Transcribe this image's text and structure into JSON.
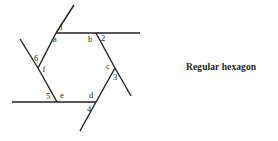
{
  "figure": {
    "caption": {
      "text": "Regular hexagon",
      "x": 186,
      "y": 62
    },
    "stroke_color": "#231f20",
    "background_color": "#ffffff",
    "shape": {
      "name": "regular-hexagon",
      "vertices": [
        {
          "label": "a",
          "x": 56,
          "y": 33,
          "label_x": 55,
          "label_y": 40
        },
        {
          "label": "b",
          "x": 96,
          "y": 33,
          "label_x": 90,
          "label_y": 40
        },
        {
          "label": "c",
          "x": 115,
          "y": 68,
          "label_x": 108,
          "label_y": 67
        },
        {
          "label": "d",
          "x": 96,
          "y": 102,
          "label_x": 91,
          "label_y": 96
        },
        {
          "label": "e",
          "x": 57,
          "y": 102,
          "label_x": 62,
          "label_y": 96
        },
        {
          "label": "f",
          "x": 38,
          "y": 68,
          "label_x": 44,
          "label_y": 70
        }
      ],
      "sides": [
        {
          "name": "side-ab",
          "x1": 56,
          "y1": 33,
          "x2": 96,
          "y2": 33
        },
        {
          "name": "side-bc",
          "x1": 96,
          "y1": 33,
          "x2": 115,
          "y2": 68
        },
        {
          "name": "side-cd",
          "x1": 115,
          "y1": 68,
          "x2": 96,
          "y2": 102
        },
        {
          "name": "side-de",
          "x1": 96,
          "y1": 102,
          "x2": 57,
          "y2": 102
        },
        {
          "name": "side-ef",
          "x1": 57,
          "y1": 102,
          "x2": 38,
          "y2": 68
        },
        {
          "name": "side-fa",
          "x1": 38,
          "y1": 68,
          "x2": 56,
          "y2": 33
        }
      ],
      "extensions": [
        {
          "name": "extension-through-a",
          "x1": 56,
          "y1": 33,
          "x2": 74,
          "y2": 5
        },
        {
          "name": "extension-top-right",
          "x1": 96,
          "y1": 33,
          "x2": 140,
          "y2": 33
        },
        {
          "name": "extension-through-c",
          "x1": 115,
          "y1": 68,
          "x2": 131,
          "y2": 96
        },
        {
          "name": "extension-through-d",
          "x1": 96,
          "y1": 102,
          "x2": 80,
          "y2": 131
        },
        {
          "name": "extension-bottom-left",
          "x1": 57,
          "y1": 102,
          "x2": 12,
          "y2": 102
        },
        {
          "name": "extension-through-f",
          "x1": 38,
          "y1": 68,
          "x2": 20,
          "y2": 39
        }
      ],
      "exterior_angles": [
        {
          "label": "1",
          "x": 61,
          "y": 28
        },
        {
          "label": "2",
          "x": 103,
          "y": 39
        },
        {
          "label": "3",
          "x": 115,
          "y": 78
        },
        {
          "label": "4",
          "x": 89,
          "y": 110
        },
        {
          "label": "5",
          "x": 48,
          "y": 97
        },
        {
          "label": "6",
          "x": 36,
          "y": 59
        }
      ]
    }
  }
}
